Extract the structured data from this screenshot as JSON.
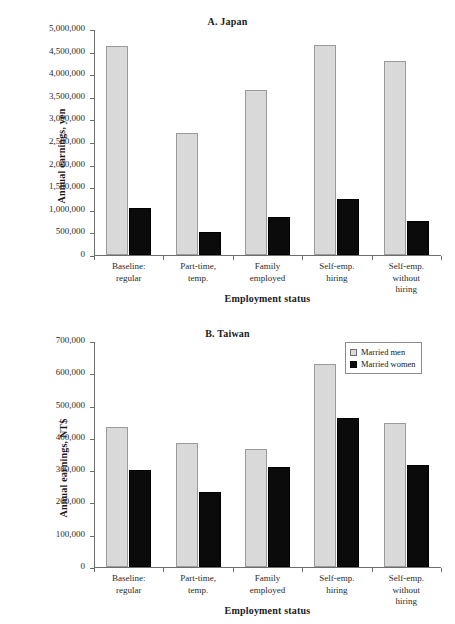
{
  "chart_data": [
    {
      "type": "bar",
      "id": "japan",
      "title": "A. Japan",
      "xlabel": "Employment status",
      "ylabel": "Annual earnings, yen",
      "ylim": [
        0,
        5000000
      ],
      "ytick_step": 500000,
      "ytick_labels": [
        "0",
        "500,000",
        "1,000,000",
        "1,500,000",
        "2,000,000",
        "2,500,000",
        "3,000,000",
        "3,500,000",
        "4,000,000",
        "4,500,000",
        "5,000,000"
      ],
      "ytick_values": [
        0,
        500000,
        1000000,
        1500000,
        2000000,
        2500000,
        3000000,
        3500000,
        4000000,
        4500000,
        5000000
      ],
      "grid": false,
      "legend": false,
      "categories": [
        "Baseline:\nregular",
        "Part-time,\ntemp.",
        "Family\nemployed",
        "Self-emp.\nhiring",
        "Self-emp.\nwithout\nhiring"
      ],
      "series": [
        {
          "name": "Married men",
          "color": "#d9d9d9",
          "values": [
            4630000,
            2710000,
            3660000,
            4640000,
            4290000
          ]
        },
        {
          "name": "Married women",
          "color": "#0b0b0b",
          "values": [
            1050000,
            520000,
            830000,
            1230000,
            760000
          ]
        }
      ]
    },
    {
      "type": "bar",
      "id": "taiwan",
      "title": "B. Taiwan",
      "xlabel": "Employment status",
      "ylabel": "Annual earnings, NT$",
      "ylim": [
        0,
        700000
      ],
      "ytick_step": 100000,
      "ytick_labels": [
        "0",
        "100,000",
        "200,000",
        "300,000",
        "400,000",
        "500,000",
        "600,000",
        "700,000"
      ],
      "ytick_values": [
        0,
        100000,
        200000,
        300000,
        400000,
        500000,
        600000,
        700000
      ],
      "grid": false,
      "legend": true,
      "legend_position": "top-right",
      "categories": [
        "Baseline:\nregular",
        "Part-time,\ntemp.",
        "Family\nemployed",
        "Self-emp.\nhiring",
        "Self-emp.\nwithout\nhiring"
      ],
      "series": [
        {
          "name": "Married men",
          "color": "#d9d9d9",
          "values": [
            435000,
            383000,
            365000,
            628000,
            445000
          ]
        },
        {
          "name": "Married women",
          "color": "#0b0b0b",
          "values": [
            300000,
            233000,
            310000,
            461000,
            315000
          ]
        }
      ]
    }
  ]
}
